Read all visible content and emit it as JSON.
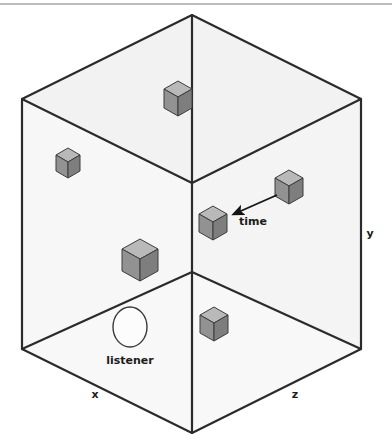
{
  "figure": {
    "width": 392,
    "height": 447,
    "background": "#ffffff",
    "top_rule": {
      "present": true,
      "color": "#6f6f6f",
      "y": 4
    }
  },
  "room": {
    "description": "Open isometric box drawn as a hexagon outline with three interior edges meeting at a central hub",
    "outline_color": "#2b2b2b",
    "outline_width": 2.2,
    "vertices": {
      "top_apex": [
        192,
        15
      ],
      "left_top": [
        22,
        99
      ],
      "right_top": [
        361,
        99
      ],
      "left_bottom": [
        22,
        349
      ],
      "right_bottom": [
        361,
        349
      ],
      "bottom_apex": [
        192,
        433
      ],
      "hub_top": [
        192,
        183
      ],
      "hub_bottom": [
        192,
        272
      ]
    },
    "faces": [
      {
        "name": "ceiling-face",
        "fill": "#f2f2f2"
      },
      {
        "name": "left-wall-face",
        "fill": "#f6f6f6"
      },
      {
        "name": "right-wall-face",
        "fill": "#f4f4f4"
      },
      {
        "name": "floor-face",
        "fill": "#f7f7f7"
      }
    ]
  },
  "cubes": [
    {
      "id": "cube-ceiling",
      "cx": 178,
      "cy": 98,
      "size": 17,
      "label": "cube on ceiling"
    },
    {
      "id": "cube-left-upper",
      "cx": 68,
      "cy": 161,
      "size": 13,
      "label": "cube on left wall upper"
    },
    {
      "id": "cube-left-large",
      "cx": 140,
      "cy": 259,
      "size": 19,
      "label": "large cube on left wall"
    },
    {
      "id": "cube-center",
      "cx": 213,
      "cy": 222,
      "size": 15,
      "label": "cube at arrow head"
    },
    {
      "id": "cube-right-upper",
      "cx": 289,
      "cy": 186,
      "size": 15,
      "label": "cube on right wall upper"
    },
    {
      "id": "cube-floor",
      "cx": 214,
      "cy": 323,
      "size": 15,
      "label": "cube on floor"
    }
  ],
  "cube_style": {
    "top_fill": "#b4b4b4",
    "left_fill": "#8f8f8f",
    "right_fill": "#7c7c7c",
    "stroke": "#3d3d3d"
  },
  "listener": {
    "label": "listener",
    "cx": 130,
    "cy": 327,
    "rx": 17,
    "ry": 20,
    "fill": "#fcfcfc",
    "stroke": "#3a3a3a",
    "label_x": 130,
    "label_y": 364
  },
  "arrow": {
    "label": "time",
    "from": [
      277,
      195
    ],
    "to": [
      231,
      215
    ],
    "color": "#141414",
    "label_x": 239,
    "label_y": 224
  },
  "axes": [
    {
      "id": "axis-x",
      "label": "x",
      "x": 95,
      "y": 398
    },
    {
      "id": "axis-z",
      "label": "z",
      "x": 295,
      "y": 398
    },
    {
      "id": "axis-y",
      "label": "y",
      "x": 370,
      "y": 237
    }
  ]
}
